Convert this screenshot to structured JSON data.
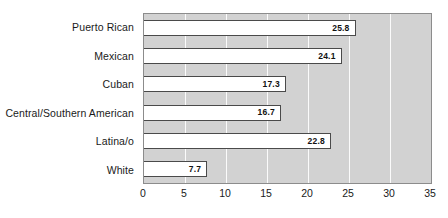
{
  "chart_data": {
    "type": "bar",
    "orientation": "horizontal",
    "title": "",
    "subtitle": "",
    "xlabel": "",
    "ylabel": "",
    "xlim": [
      0,
      35
    ],
    "ylim": null,
    "grid": true,
    "legend": null,
    "legend_position": "none",
    "categories": [
      "Puerto Rican",
      "Mexican",
      "Cuban",
      "Central/Southern American",
      "Latina/o",
      "White"
    ],
    "values": [
      25.8,
      24.1,
      17.3,
      16.7,
      22.8,
      7.7
    ],
    "value_labels": [
      "25.8",
      "24.1",
      "17.3",
      "16.7",
      "22.8",
      "7.7"
    ],
    "xticks": [
      0,
      5,
      10,
      15,
      20,
      25,
      30,
      35
    ],
    "xtick_labels": [
      "0",
      "5",
      "10",
      "15",
      "20",
      "25",
      "30",
      "35"
    ],
    "colors": {
      "bar_fill": "#ffffff",
      "bar_border": "#4a4a4a",
      "plot_background": "#d2d2d2",
      "gridline": "#fbfbfb",
      "axis_border": "#8c8c8c",
      "text": "#1a1a1a"
    }
  }
}
